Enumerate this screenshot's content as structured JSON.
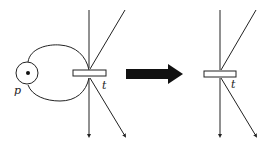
{
  "diagram": {
    "colors": {
      "stroke": "#222222",
      "arrow": "#111111",
      "background": "#ffffff"
    },
    "left": {
      "place_label": "p",
      "transition_label": "t",
      "place_tokens": 1
    },
    "arrow": {
      "icon": "right-arrow-icon"
    },
    "right": {
      "transition_label": "t"
    }
  }
}
